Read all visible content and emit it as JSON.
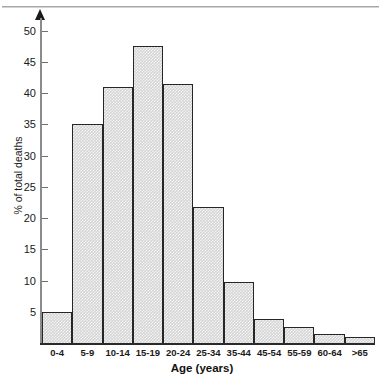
{
  "chart_data": {
    "type": "bar",
    "title": "",
    "xlabel": "Age (years)",
    "ylabel": "% of total deaths",
    "categories": [
      "0-4",
      "5-9",
      "10-14",
      "15-19",
      "20-24",
      "25-34",
      "35-44",
      "45-54",
      "55-59",
      "60-64",
      ">65"
    ],
    "values": [
      5,
      35,
      41,
      47.5,
      41.4,
      21.7,
      9.7,
      3.8,
      2.5,
      1.5,
      1
    ],
    "ylim": [
      0,
      52
    ],
    "yticks": [
      5,
      10,
      15,
      20,
      25,
      30,
      35,
      40,
      45,
      50
    ],
    "ytick_labels": [
      "5",
      "10",
      "15",
      "20",
      "25",
      "30",
      "35",
      "40",
      "45",
      "50"
    ],
    "grid": false,
    "legend": null,
    "bar_fill_color": "#d4d4d4",
    "bar_edge_color": "#262626",
    "axis_color": "#2a2a2a",
    "bar_widths_relative": [
      1,
      1,
      1,
      1,
      1,
      1,
      1,
      1,
      1,
      1,
      1
    ],
    "y_axis_has_arrow": true
  },
  "axes": {
    "y_axis_title": "% of total deaths",
    "x_axis_title": "Age (years)"
  }
}
